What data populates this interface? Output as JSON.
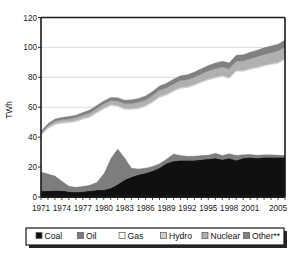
{
  "chart_data": {
    "type": "area",
    "title": "",
    "xlabel": "",
    "ylabel": "TWh",
    "ylim": [
      0,
      120
    ],
    "ytick_labels": [
      "0",
      "20",
      "40",
      "60",
      "80",
      "100",
      "120"
    ],
    "yticks": [
      0,
      20,
      40,
      60,
      80,
      100,
      120
    ],
    "grid": true,
    "grid_axis": "y",
    "legend_position": "bottom",
    "stacked": true,
    "x": [
      1971,
      1972,
      1973,
      1974,
      1975,
      1976,
      1977,
      1978,
      1979,
      1980,
      1981,
      1982,
      1983,
      1984,
      1985,
      1986,
      1987,
      1988,
      1989,
      1990,
      1991,
      1992,
      1993,
      1994,
      1995,
      1996,
      1997,
      1998,
      1999,
      2000,
      2001,
      2002,
      2003,
      2004,
      2005,
      2006
    ],
    "xtick_labels": [
      "1971",
      "1974",
      "1977",
      "1980",
      "1983",
      "1986",
      "1989",
      "1992",
      "1995",
      "1998",
      "2001",
      "2005"
    ],
    "xticks": [
      1971,
      1974,
      1977,
      1980,
      1983,
      1986,
      1989,
      1992,
      1995,
      1998,
      2001,
      2005
    ],
    "series": [
      {
        "name": "Coal",
        "color": "#101010",
        "values": [
          4.0,
          4.2,
          4.4,
          4.3,
          3.6,
          3.3,
          3.6,
          4.2,
          4.6,
          4.8,
          6.0,
          8.5,
          11.5,
          13.5,
          15.0,
          16.0,
          17.5,
          19.5,
          22.5,
          24.0,
          24.5,
          24.5,
          24.5,
          25.0,
          25.5,
          26.0,
          25.0,
          26.0,
          24.5,
          26.0,
          26.5,
          26.0,
          26.5,
          26.5,
          26.5,
          26.5
        ]
      },
      {
        "name": "Oil",
        "color": "#7d7d7d",
        "values": [
          13.0,
          11.5,
          10.0,
          6.5,
          4.0,
          3.5,
          3.8,
          4.0,
          5.5,
          11.0,
          20.0,
          24.0,
          15.0,
          6.0,
          4.0,
          3.5,
          3.2,
          3.0,
          3.0,
          5.0,
          3.5,
          3.0,
          3.0,
          3.0,
          2.8,
          3.5,
          3.0,
          3.2,
          3.5,
          2.5,
          2.2,
          2.2,
          2.0,
          2.0,
          1.8,
          1.5
        ]
      },
      {
        "name": "Gas",
        "color": "#ffffff",
        "values": [
          24.0,
          30.0,
          34.0,
          38.5,
          42.0,
          43.5,
          44.5,
          45.0,
          46.0,
          43.0,
          35.0,
          28.0,
          32.0,
          39.0,
          40.0,
          41.0,
          42.5,
          44.0,
          42.5,
          41.5,
          44.5,
          45.5,
          47.0,
          48.5,
          50.0,
          50.0,
          52.5,
          50.0,
          56.0,
          55.5,
          56.5,
          58.0,
          59.0,
          60.0,
          61.0,
          64.0
        ]
      },
      {
        "name": "Hydro",
        "color": "#cfcfcf",
        "values": [
          0.8,
          0.8,
          0.8,
          0.8,
          0.8,
          0.8,
          0.8,
          0.8,
          0.8,
          0.8,
          0.8,
          0.8,
          0.8,
          0.8,
          0.8,
          0.8,
          0.8,
          0.8,
          0.8,
          0.8,
          0.8,
          0.8,
          0.8,
          0.8,
          0.8,
          0.8,
          0.8,
          0.8,
          0.8,
          0.8,
          0.8,
          0.8,
          0.8,
          0.8,
          0.8,
          0.8
        ]
      },
      {
        "name": "Nuclear",
        "color": "#b0b0b0",
        "values": [
          1.0,
          1.2,
          1.5,
          1.6,
          1.8,
          1.9,
          2.0,
          2.2,
          2.3,
          2.5,
          2.6,
          2.8,
          3.0,
          3.2,
          3.5,
          3.6,
          3.8,
          4.0,
          4.2,
          4.3,
          4.5,
          4.6,
          4.8,
          5.0,
          5.2,
          5.5,
          5.6,
          5.8,
          6.0,
          6.2,
          6.5,
          6.8,
          7.0,
          7.2,
          7.5,
          7.5
        ]
      },
      {
        "name": "Other**",
        "color": "#808080",
        "values": [
          1.2,
          1.3,
          1.4,
          1.5,
          1.6,
          1.7,
          1.8,
          1.9,
          2.0,
          2.1,
          2.2,
          2.3,
          2.4,
          2.5,
          2.6,
          2.7,
          2.8,
          2.9,
          3.0,
          3.1,
          3.2,
          3.3,
          3.4,
          3.5,
          3.6,
          3.7,
          3.8,
          3.9,
          4.0,
          4.1,
          4.2,
          4.3,
          4.4,
          4.5,
          4.6,
          4.6
        ]
      }
    ]
  },
  "legend": {
    "items": [
      {
        "label": "Coal",
        "color": "#101010"
      },
      {
        "label": "Oil",
        "color": "#7d7d7d"
      },
      {
        "label": "Gas",
        "color": "#ffffff"
      },
      {
        "label": "Hydro",
        "color": "#cfcfcf"
      },
      {
        "label": "Nuclear",
        "color": "#b0b0b0"
      },
      {
        "label": "Other**",
        "color": "#808080"
      }
    ]
  },
  "style": {
    "plot_border": "#1a1a1a",
    "gridline": "#d9d9d9",
    "background": "#ffffff"
  }
}
